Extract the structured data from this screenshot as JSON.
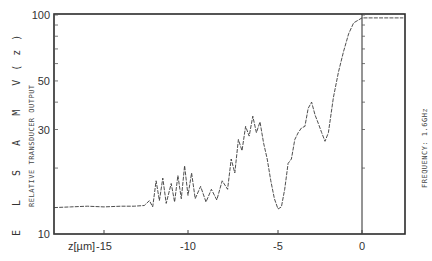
{
  "chart_data": {
    "type": "line",
    "title": "",
    "left_title": "E L S A M  V(z)",
    "ylabel": "RELATIVE TRANSDUCER OUTPUT",
    "xlabel": "z[µm]",
    "right_annotation": "FREQUENCY: 1.6GHz",
    "yscale": "log",
    "ylim": [
      10,
      100
    ],
    "xlim": [
      -18,
      2.5
    ],
    "y_tick_labels": [
      "100",
      "50",
      "30",
      "10"
    ],
    "y_ticks": [
      100,
      50,
      30,
      10
    ],
    "x_tick_labels": [
      "-15",
      "-10",
      "-5",
      "0"
    ],
    "x_ticks": [
      -15,
      -10,
      -5,
      0
    ],
    "grid": false,
    "legend": null,
    "reference_line": {
      "axis": "x",
      "value": 0
    },
    "series": [
      {
        "name": "V(z)",
        "style": "dashed",
        "points": [
          [
            -18.0,
            13.2
          ],
          [
            -17.0,
            13.3
          ],
          [
            -16.0,
            13.4
          ],
          [
            -15.0,
            13.3
          ],
          [
            -14.0,
            13.4
          ],
          [
            -13.2,
            13.4
          ],
          [
            -12.6,
            13.5
          ],
          [
            -12.3,
            14.2
          ],
          [
            -12.1,
            13.3
          ],
          [
            -11.9,
            17.5
          ],
          [
            -11.7,
            14.2
          ],
          [
            -11.5,
            18.0
          ],
          [
            -11.3,
            13.8
          ],
          [
            -11.0,
            17.0
          ],
          [
            -10.8,
            14.0
          ],
          [
            -10.6,
            18.5
          ],
          [
            -10.4,
            14.5
          ],
          [
            -10.2,
            20.5
          ],
          [
            -10.0,
            15.0
          ],
          [
            -9.8,
            19.0
          ],
          [
            -9.6,
            14.5
          ],
          [
            -9.3,
            16.5
          ],
          [
            -9.0,
            14.0
          ],
          [
            -8.7,
            16.0
          ],
          [
            -8.4,
            14.3
          ],
          [
            -8.1,
            17.5
          ],
          [
            -7.8,
            16.0
          ],
          [
            -7.6,
            22.0
          ],
          [
            -7.4,
            19.0
          ],
          [
            -7.2,
            27.0
          ],
          [
            -7.0,
            24.0
          ],
          [
            -6.8,
            31.0
          ],
          [
            -6.6,
            28.0
          ],
          [
            -6.4,
            34.5
          ],
          [
            -6.2,
            29.0
          ],
          [
            -6.0,
            32.5
          ],
          [
            -5.8,
            26.0
          ],
          [
            -5.6,
            22.0
          ],
          [
            -5.4,
            17.5
          ],
          [
            -5.2,
            14.5
          ],
          [
            -5.0,
            13.0
          ],
          [
            -4.8,
            13.3
          ],
          [
            -4.6,
            16.0
          ],
          [
            -4.4,
            21.0
          ],
          [
            -4.2,
            22.0
          ],
          [
            -4.0,
            27.0
          ],
          [
            -3.8,
            29.0
          ],
          [
            -3.6,
            30.5
          ],
          [
            -3.4,
            31.0
          ],
          [
            -3.2,
            37.5
          ],
          [
            -3.0,
            40.0
          ],
          [
            -2.8,
            35.0
          ],
          [
            -2.6,
            32.0
          ],
          [
            -2.4,
            29.0
          ],
          [
            -2.2,
            26.5
          ],
          [
            -2.0,
            29.0
          ],
          [
            -1.7,
            42.0
          ],
          [
            -1.4,
            55.0
          ],
          [
            -1.1,
            68.0
          ],
          [
            -0.8,
            82.0
          ],
          [
            -0.5,
            92.0
          ],
          [
            0.0,
            97.0
          ],
          [
            1.0,
            97.0
          ],
          [
            2.4,
            97.0
          ]
        ]
      }
    ]
  }
}
